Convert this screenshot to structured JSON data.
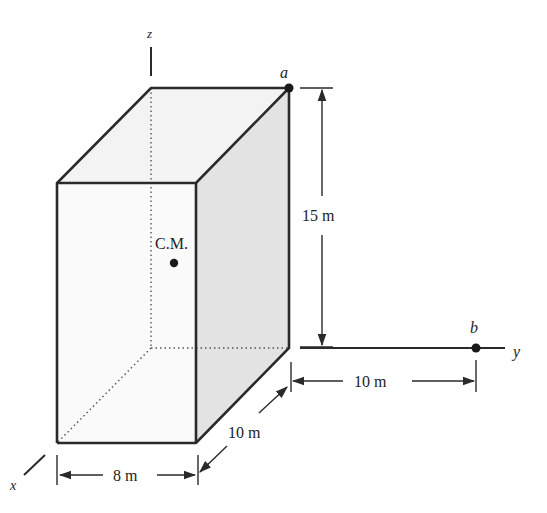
{
  "figure": {
    "type": "3D rectangular block with axes and dimensions",
    "axes": {
      "x_label": "x",
      "y_label": "y",
      "z_label": "z"
    },
    "points": {
      "a": {
        "label": "a"
      },
      "b": {
        "label": "b"
      },
      "cm": {
        "label": "C.M."
      }
    },
    "dimensions": {
      "height": "15 m",
      "depth": "10 m",
      "width": "8 m",
      "b_offset": "10 m"
    },
    "colors": {
      "stroke": "#2a2a2a",
      "shaded_face": "#e6e6e6",
      "light_face": "#f6f6f6",
      "front_face": "#fbfbfb"
    }
  }
}
